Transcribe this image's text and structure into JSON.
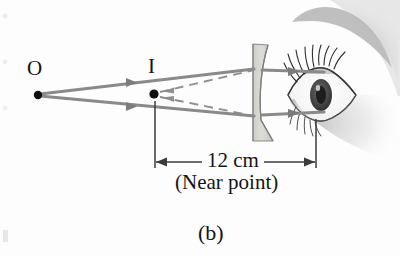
{
  "figure": {
    "panel_label": "(b)",
    "caption_note": "(Near point)",
    "distance_label": "12 cm"
  },
  "labels": {
    "object_point": "O",
    "image_point": "I"
  },
  "colors": {
    "ray": "#8a8a8a",
    "ray_dark": "#6f6f6f",
    "point": "#101010",
    "lens_fill": "#d6d6d2",
    "lens_stroke": "#8d8d8d",
    "dimension": "#3a3a3a",
    "text": "#141414",
    "background": "#fdfdfd"
  },
  "diagram": {
    "type": "ray-optics",
    "optic": "diverging-lens",
    "object_point_xy": [
      38,
      95
    ],
    "image_point_xy": [
      154,
      94
    ],
    "lens_x": 258,
    "eye_x": 330,
    "rays": [
      {
        "name": "upper-ray",
        "from": [
          38,
          95
        ],
        "to_lens": [
          255,
          70
        ],
        "to_eye": [
          322,
          72
        ],
        "style": "solid"
      },
      {
        "name": "lower-ray",
        "from": [
          38,
          95
        ],
        "to_lens": [
          255,
          116
        ],
        "to_eye": [
          322,
          112
        ],
        "style": "solid"
      }
    ],
    "virtual_rays": [
      {
        "name": "upper-virtual-extension",
        "from": [
          154,
          94
        ],
        "to": [
          255,
          70
        ],
        "style": "dashed"
      },
      {
        "name": "lower-virtual-extension",
        "from": [
          154,
          94
        ],
        "to": [
          255,
          116
        ],
        "style": "dashed"
      }
    ],
    "dimension": {
      "name": "near-point-distance",
      "from_x": 155,
      "to_x": 316,
      "y": 162,
      "value": "12 cm"
    }
  }
}
